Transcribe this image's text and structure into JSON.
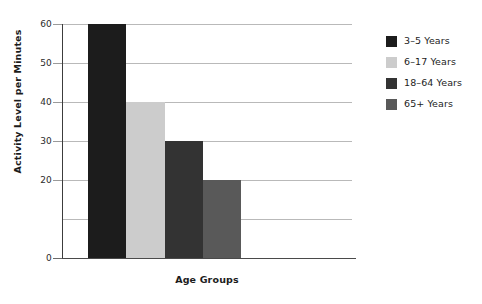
{
  "chart_data": {
    "type": "bar",
    "title": "",
    "subtitle": "",
    "xlabel": "Age Groups",
    "ylabel": "Activity Level per Minutes",
    "categories": [
      "3–5 Years",
      "6–17 Years",
      "18–64 Years",
      "65+ Years"
    ],
    "values": [
      60,
      40,
      30,
      20
    ],
    "series": [
      {
        "name": "Activity Level per Minutes",
        "values": [
          60,
          40,
          30,
          20
        ]
      }
    ],
    "bar_colors": [
      "#1c1c1c",
      "#cccccc",
      "#333333",
      "#595959"
    ],
    "ylim": [
      0,
      60
    ],
    "ytick_values": [
      60,
      50,
      40,
      30,
      20,
      0
    ],
    "ytick_labels": [
      "60",
      "50",
      "40",
      "30",
      "20",
      "0"
    ],
    "gridline_values": [
      60,
      50,
      40,
      30,
      20,
      10,
      0
    ],
    "grid": true,
    "grid_axis": "y",
    "grid_color": "#b9b9b9",
    "legend_position": "right",
    "legend": [
      {
        "label": "3–5 Years",
        "color": "#1c1c1c"
      },
      {
        "label": "6–17 Years",
        "color": "#cccccc"
      },
      {
        "label": "18–64 Years",
        "color": "#333333"
      },
      {
        "label": "65+ Years",
        "color": "#595959"
      }
    ],
    "bars_contiguous": true,
    "background_color": "#ffffff",
    "axis_color": "#4a4a4a",
    "text_color": "#1c1c1c"
  }
}
